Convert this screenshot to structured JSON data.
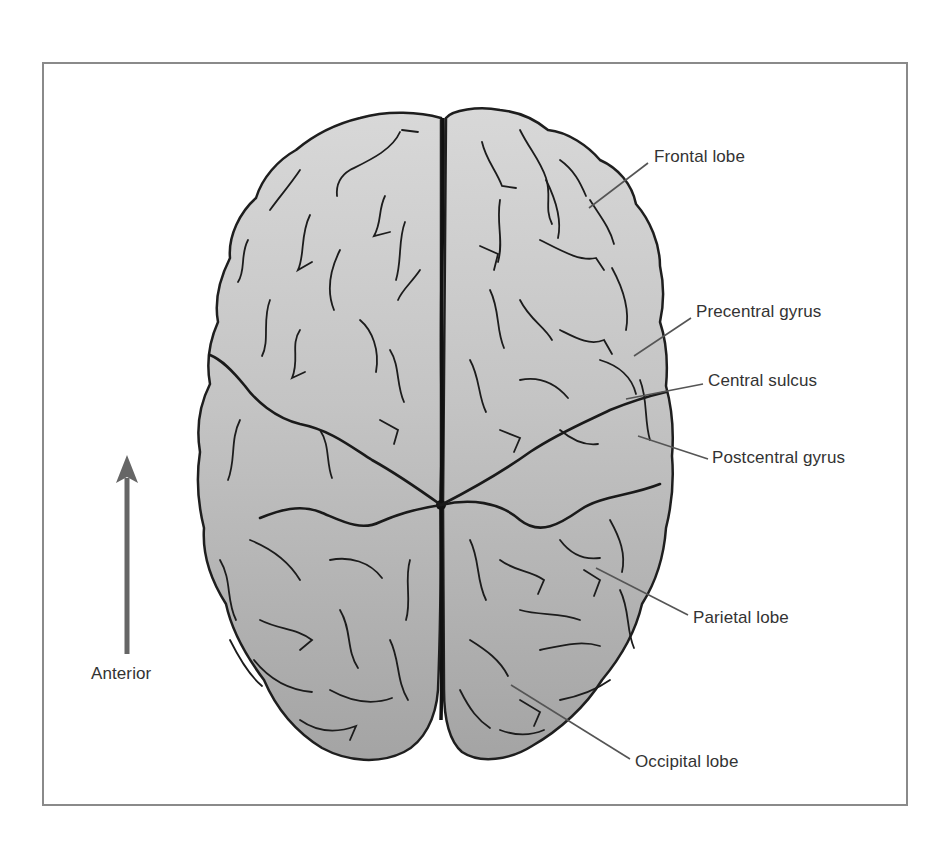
{
  "diagram": {
    "colors": {
      "frame": "#8a8a8a",
      "brain_fill_top": "#d6d6d6",
      "brain_fill_bottom": "#a6a6a6",
      "outline": "#1e1e1e",
      "leader_line": "#555555",
      "label_text": "#333333",
      "arrow": "#666666"
    },
    "orientation": {
      "arrow_direction": "up",
      "label": "Anterior"
    },
    "labels": [
      {
        "id": "frontal-lobe",
        "text": "Frontal lobe"
      },
      {
        "id": "precentral-gyrus",
        "text": "Precentral gyrus"
      },
      {
        "id": "central-sulcus",
        "text": "Central sulcus"
      },
      {
        "id": "postcentral-gyrus",
        "text": "Postcentral gyrus"
      },
      {
        "id": "parietal-lobe",
        "text": "Parietal lobe"
      },
      {
        "id": "occipital-lobe",
        "text": "Occipital lobe"
      }
    ]
  }
}
